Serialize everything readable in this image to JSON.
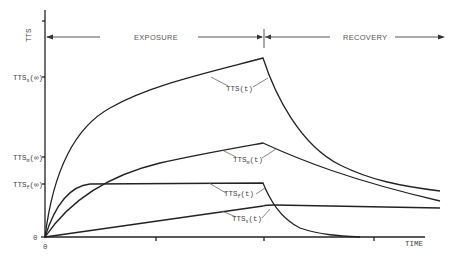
{
  "figure": {
    "y_axis_label": "TTS",
    "x_axis_label": "TIME",
    "origin_x_label": "0",
    "origin_y_label": "0",
    "phases": {
      "exposure": "EXPOSURE",
      "recovery": "RECOVERY"
    },
    "y_ticks": [
      {
        "base": "TTS",
        "sub": "s",
        "suffix": "(∞)"
      },
      {
        "base": "TTS",
        "sub": "m",
        "suffix": "(∞)"
      },
      {
        "base": "TTS",
        "sub": "f",
        "suffix": "(∞)"
      }
    ],
    "curve_labels": {
      "total": {
        "base": "TTS(t)"
      },
      "medium": {
        "base": "TTS",
        "sub": "m",
        "suffix": "(t)"
      },
      "fast": {
        "base": "TTS",
        "sub": "f",
        "suffix": "(t)"
      },
      "slow": {
        "base": "TTS",
        "sub": "s",
        "suffix": "(t)"
      }
    },
    "colors": {
      "line": "#222222",
      "text": "#444444",
      "background": "#ffffff"
    }
  }
}
